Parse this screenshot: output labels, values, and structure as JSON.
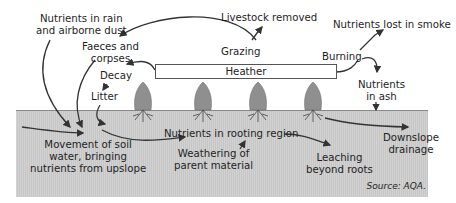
{
  "diagram": {
    "colors": {
      "soil": "#cccccc",
      "soil_line": "#8a8a8a",
      "arrow": "#333333",
      "plant": "#8f8f8f"
    },
    "labels": {
      "rain_dust": [
        "Nutrients in rain",
        "and airborne dust"
      ],
      "faeces": [
        "Faeces and",
        "corpses"
      ],
      "decay": "Decay",
      "litter": "Litter",
      "livestock": "Livestock removed",
      "grazing": "Grazing",
      "heather": "Heather",
      "burning": "Burning",
      "smoke": "Nutrients lost in smoke",
      "ash": [
        "Nutrients",
        "in ash"
      ],
      "soil_water": [
        "Movement of soil",
        "water, bringing",
        "nutrients from upslope"
      ],
      "rooting": "Nutrients in rooting region",
      "weathering": [
        "Weathering of",
        "parent material"
      ],
      "leaching": [
        "Leaching",
        "beyond roots"
      ],
      "downslope": [
        "Downslope",
        "drainage"
      ]
    },
    "source": "Source: AQA."
  }
}
